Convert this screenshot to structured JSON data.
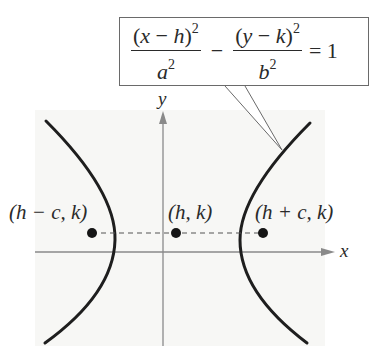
{
  "diagram": {
    "type": "hyperbola-horizontal-transverse-axis",
    "equation": {
      "term1": {
        "numerator_open": "(",
        "numerator_var": "x",
        "numerator_minus": " − ",
        "numerator_shift": "h",
        "numerator_close": ")",
        "numerator_exp": "2",
        "denominator_var": "a",
        "denominator_exp": "2"
      },
      "operator": "−",
      "term2": {
        "numerator_open": "(",
        "numerator_var": "y",
        "numerator_minus": " − ",
        "numerator_shift": "k",
        "numerator_close": ")",
        "numerator_exp": "2",
        "denominator_var": "b",
        "denominator_exp": "2"
      },
      "equals": "= 1"
    },
    "axes": {
      "x_label": "x",
      "y_label": "y"
    },
    "points": [
      {
        "name": "left-focus",
        "label": "(h − c, k)"
      },
      {
        "name": "center",
        "label": "(h, k)"
      },
      {
        "name": "right-focus",
        "label": "(h + c, k)"
      }
    ],
    "colors": {
      "curve": "#1e1e1e",
      "axis": "#8a8a8a",
      "text": "#2a2a2a",
      "point": "#151515",
      "shade": "#f6f6f4",
      "callout_border": "#6a6a6a"
    }
  }
}
